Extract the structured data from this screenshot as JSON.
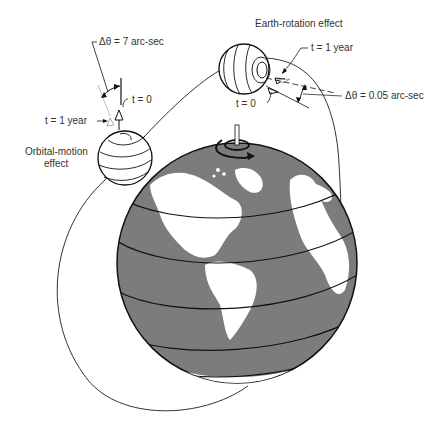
{
  "labels": {
    "earth_rotation_title": "Earth-rotation effect",
    "orbital_motion_title_line1": "Orbital-motion",
    "orbital_motion_title_line2": "effect",
    "left_delta": "Δθ  =  7 arc-sec",
    "left_t0": "t  =  0",
    "left_t1": "t  =  1 year",
    "right_t1": "t  =  1 year",
    "right_t0": "t  =  0",
    "right_delta": "Δθ  =  0.05 arc-sec"
  },
  "colors": {
    "land": "#ffffff",
    "ocean": "#7c7c7c",
    "line": "#222222"
  },
  "icons": {
    "earth": "globe-icon",
    "left_body": "sphere-icon",
    "right_body": "sphere-icon"
  }
}
